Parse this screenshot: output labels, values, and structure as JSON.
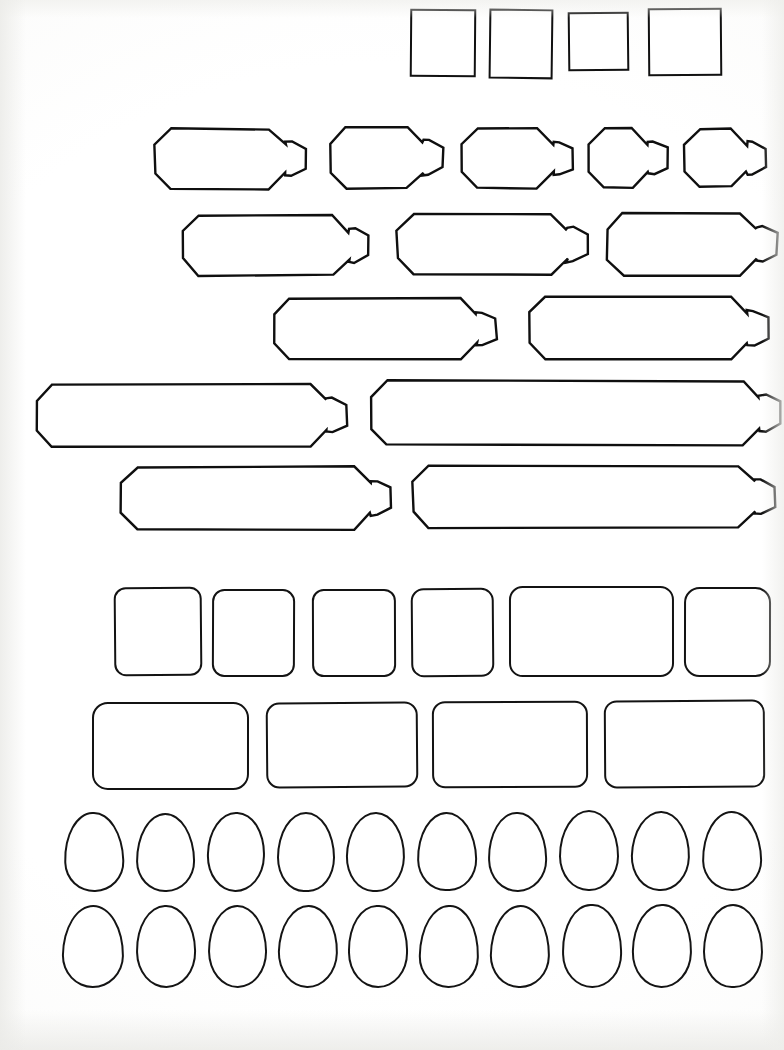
{
  "document": {
    "title": "Blank Shape Template Sheet",
    "kind": "scanned-worksheet",
    "description": "Scanned sheet of hand-drawn blank outline shapes used as label / sticker templates",
    "page_width": 784,
    "page_height": 1050,
    "background_color": "#ffffff",
    "ink_color": "#111111",
    "total_shapes": 50
  },
  "rows": [
    {
      "id": "row-squares",
      "name": "square-row",
      "shape_type": "square",
      "count": 4,
      "label": "Row 1 — plain squares",
      "shapes": [
        {
          "x": 410,
          "y": 9,
          "w": 66,
          "h": 68
        },
        {
          "x": 489,
          "y": 9,
          "w": 64,
          "h": 70
        },
        {
          "x": 568,
          "y": 12,
          "w": 61,
          "h": 59
        },
        {
          "x": 648,
          "y": 8,
          "w": 74,
          "h": 68
        }
      ]
    },
    {
      "id": "row-tags-1",
      "name": "tag-row-1",
      "shape_type": "tag",
      "count": 5,
      "label": "Row 2 — tags, medium width",
      "shapes": [
        {
          "x": 152,
          "y": 126,
          "w": 150,
          "h": 60
        },
        {
          "x": 327,
          "y": 124,
          "w": 113,
          "h": 61
        },
        {
          "x": 458,
          "y": 126,
          "w": 112,
          "h": 59
        },
        {
          "x": 585,
          "y": 126,
          "w": 79,
          "h": 58
        },
        {
          "x": 681,
          "y": 126,
          "w": 82,
          "h": 58
        }
      ]
    },
    {
      "id": "row-tags-2",
      "name": "tag-row-2",
      "shape_type": "tag",
      "count": 3,
      "label": "Row 3 — tags, wide",
      "shapes": [
        {
          "x": 180,
          "y": 213,
          "w": 185,
          "h": 59
        },
        {
          "x": 394,
          "y": 211,
          "w": 190,
          "h": 61
        },
        {
          "x": 604,
          "y": 210,
          "w": 170,
          "h": 62
        }
      ]
    },
    {
      "id": "row-tags-3",
      "name": "tag-row-3",
      "shape_type": "tag",
      "count": 2,
      "label": "Row 4 — tags, extra wide",
      "shapes": [
        {
          "x": 271,
          "y": 296,
          "w": 222,
          "h": 60
        },
        {
          "x": 527,
          "y": 294,
          "w": 238,
          "h": 62
        }
      ]
    },
    {
      "id": "row-tags-4",
      "name": "tag-row-4",
      "shape_type": "tag",
      "count": 2,
      "label": "Row 5 — tags, long banner",
      "shapes": [
        {
          "x": 33,
          "y": 381,
          "w": 311,
          "h": 62
        },
        {
          "x": 368,
          "y": 378,
          "w": 409,
          "h": 64
        }
      ]
    },
    {
      "id": "row-tags-5",
      "name": "tag-row-5",
      "shape_type": "tag",
      "count": 2,
      "label": "Row 6 — tags, long banner",
      "shapes": [
        {
          "x": 118,
          "y": 464,
          "w": 270,
          "h": 62
        },
        {
          "x": 410,
          "y": 463,
          "w": 362,
          "h": 62
        }
      ]
    },
    {
      "id": "row-rrect-1",
      "name": "rounded-rect-row-1",
      "shape_type": "rounded-rect",
      "count": 6,
      "label": "Row 7 — upright rounded rectangles",
      "shapes": [
        {
          "x": 114,
          "y": 587,
          "w": 88,
          "h": 89
        },
        {
          "x": 212,
          "y": 589,
          "w": 83,
          "h": 88
        },
        {
          "x": 312,
          "y": 589,
          "w": 84,
          "h": 88
        },
        {
          "x": 411,
          "y": 588,
          "w": 83,
          "h": 89
        },
        {
          "x": 509,
          "y": 586,
          "w": 165,
          "h": 91
        },
        {
          "x": 684,
          "y": 587,
          "w": 87,
          "h": 90
        }
      ]
    },
    {
      "id": "row-rrect-2",
      "name": "rounded-rect-row-2",
      "shape_type": "rounded-rect",
      "count": 4,
      "label": "Row 8 — wide rounded rectangles",
      "shapes": [
        {
          "x": 92,
          "y": 702,
          "w": 157,
          "h": 88
        },
        {
          "x": 266,
          "y": 702,
          "w": 152,
          "h": 86
        },
        {
          "x": 432,
          "y": 701,
          "w": 156,
          "h": 87
        },
        {
          "x": 604,
          "y": 700,
          "w": 161,
          "h": 88
        }
      ]
    },
    {
      "id": "row-eggs-1",
      "name": "egg-row-1",
      "shape_type": "egg",
      "count": 10,
      "label": "Row 9 — egg ovals",
      "shapes": [
        {
          "x": 64,
          "y": 812,
          "w": 60,
          "h": 80
        },
        {
          "x": 136,
          "y": 813,
          "w": 59,
          "h": 79
        },
        {
          "x": 207,
          "y": 812,
          "w": 58,
          "h": 80
        },
        {
          "x": 277,
          "y": 812,
          "w": 58,
          "h": 80
        },
        {
          "x": 346,
          "y": 812,
          "w": 59,
          "h": 80
        },
        {
          "x": 417,
          "y": 812,
          "w": 60,
          "h": 79
        },
        {
          "x": 488,
          "y": 812,
          "w": 59,
          "h": 80
        },
        {
          "x": 559,
          "y": 810,
          "w": 60,
          "h": 81
        },
        {
          "x": 631,
          "y": 811,
          "w": 59,
          "h": 80
        },
        {
          "x": 702,
          "y": 811,
          "w": 60,
          "h": 80
        }
      ]
    },
    {
      "id": "row-eggs-2",
      "name": "egg-row-2",
      "shape_type": "egg",
      "count": 10,
      "label": "Row 10 — egg ovals",
      "shapes": [
        {
          "x": 62,
          "y": 905,
          "w": 62,
          "h": 83
        },
        {
          "x": 136,
          "y": 905,
          "w": 60,
          "h": 83
        },
        {
          "x": 208,
          "y": 905,
          "w": 59,
          "h": 83
        },
        {
          "x": 278,
          "y": 905,
          "w": 60,
          "h": 83
        },
        {
          "x": 348,
          "y": 905,
          "w": 60,
          "h": 83
        },
        {
          "x": 419,
          "y": 905,
          "w": 60,
          "h": 83
        },
        {
          "x": 490,
          "y": 905,
          "w": 60,
          "h": 83
        },
        {
          "x": 562,
          "y": 904,
          "w": 60,
          "h": 84
        },
        {
          "x": 632,
          "y": 904,
          "w": 60,
          "h": 84
        },
        {
          "x": 703,
          "y": 904,
          "w": 60,
          "h": 84
        }
      ]
    }
  ]
}
